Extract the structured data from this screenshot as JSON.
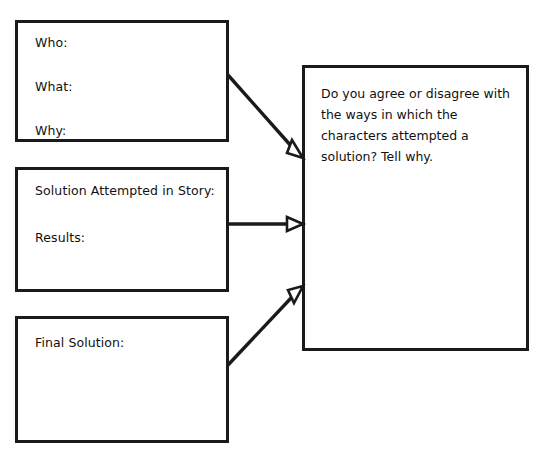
{
  "worksheet": {
    "background_color": "#ffffff",
    "stroke_color": "#1a1a1a",
    "text_color": "#111111",
    "boxes": {
      "who_box": {
        "name": "who-what-why-box",
        "lines": [
          "Who:",
          "What:",
          "Why:"
        ]
      },
      "attempt_box": {
        "name": "solution-attempted-box",
        "lines": [
          "Solution Attempted in Story:",
          "Results:"
        ]
      },
      "final_box": {
        "name": "final-solution-box",
        "lines": [
          "Final Solution:"
        ]
      },
      "prompt_box": {
        "name": "prompt-box",
        "text": "Do you agree or disagree with the ways in which the characters attempted a solution? Tell why."
      }
    },
    "connectors": [
      {
        "name": "arrow-who-to-prompt",
        "from": "who-what-why-box",
        "to": "prompt-box",
        "style": "diagonal-down-right",
        "arrowhead": "open-triangle"
      },
      {
        "name": "arrow-attempt-to-prompt",
        "from": "solution-attempted-box",
        "to": "prompt-box",
        "style": "horizontal",
        "arrowhead": "open-triangle"
      },
      {
        "name": "arrow-final-to-prompt",
        "from": "final-solution-box",
        "to": "prompt-box",
        "style": "diagonal-up-right",
        "arrowhead": "open-triangle"
      }
    ]
  }
}
